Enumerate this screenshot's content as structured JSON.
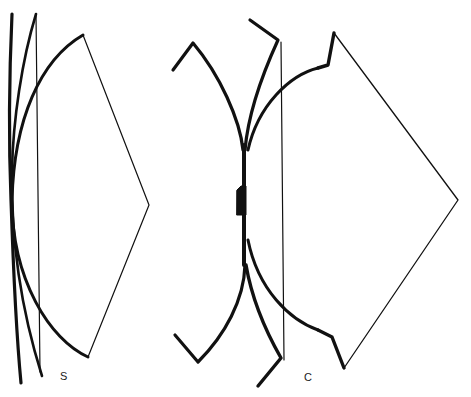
{
  "figure": {
    "type": "line-diagram",
    "background": "#ffffff",
    "stroke_color": "#111111",
    "panels": [
      {
        "id": "S",
        "label": "S",
        "description": "Sheaf of curves converging near left edge with thin vertical line and kite-shaped outline"
      },
      {
        "id": "C",
        "label": "C",
        "description": "Symmetric branching thick arcs with angled hooks, thin vertical line and kite-shaped outline"
      }
    ]
  }
}
